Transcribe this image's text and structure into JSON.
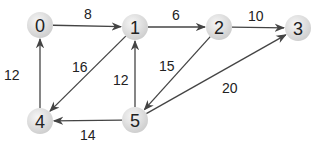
{
  "diagram": {
    "type": "directed-weighted-graph",
    "nodes": [
      {
        "id": "0",
        "label": "0",
        "x": 40,
        "y": 25
      },
      {
        "id": "1",
        "label": "1",
        "x": 135,
        "y": 27
      },
      {
        "id": "2",
        "label": "2",
        "x": 219,
        "y": 27
      },
      {
        "id": "3",
        "label": "3",
        "x": 298,
        "y": 28
      },
      {
        "id": "4",
        "label": "4",
        "x": 40,
        "y": 121
      },
      {
        "id": "5",
        "label": "5",
        "x": 135,
        "y": 120
      }
    ],
    "edges": [
      {
        "from": "0",
        "to": "1",
        "weight": "8",
        "lx": 84,
        "ly": 19
      },
      {
        "from": "1",
        "to": "2",
        "weight": "6",
        "lx": 172,
        "ly": 20
      },
      {
        "from": "2",
        "to": "3",
        "weight": "10",
        "lx": 248,
        "ly": 21
      },
      {
        "from": "1",
        "to": "4",
        "weight": "16",
        "lx": 72,
        "ly": 72
      },
      {
        "from": "4",
        "to": "0",
        "weight": "12",
        "lx": 4,
        "ly": 80
      },
      {
        "from": "5",
        "to": "1",
        "weight": "12",
        "lx": 113,
        "ly": 85
      },
      {
        "from": "2",
        "to": "5",
        "weight": "15",
        "lx": 159,
        "ly": 71
      },
      {
        "from": "5",
        "to": "3",
        "weight": "20",
        "lx": 222,
        "ly": 93
      },
      {
        "from": "5",
        "to": "4",
        "weight": "14",
        "lx": 80,
        "ly": 140
      }
    ],
    "colors": {
      "node_fill": "#dcdcdc",
      "node_highlight": "#f4f4f4",
      "edge": "#444444",
      "text": "#222222"
    }
  }
}
